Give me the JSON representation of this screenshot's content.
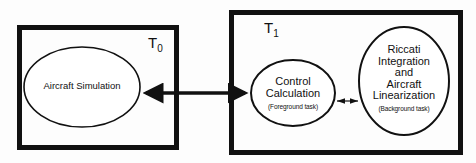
{
  "diagram": {
    "boxes": [
      {
        "id": "T0",
        "label_main": "T",
        "label_sub": "0"
      },
      {
        "id": "T1",
        "label_main": "T",
        "label_sub": "1"
      }
    ],
    "nodes": {
      "aircraft_simulation": {
        "label": "Aircraft Simulation"
      },
      "control_calculation": {
        "label_line1": "Control",
        "label_line2": "Calculation",
        "sublabel": "(Foreground task)"
      },
      "riccati": {
        "lines": [
          "Riccati",
          "Integration",
          "and",
          "Aircraft",
          "Linearization"
        ],
        "sublabel": "(Background task)"
      }
    },
    "edges": [
      {
        "from": "Aircraft Simulation",
        "to": "Control Calculation",
        "type": "bidirectional",
        "weight": "thick"
      },
      {
        "from": "Control Calculation",
        "to": "Riccati Integration and Aircraft Linearization",
        "type": "bidirectional",
        "weight": "thin"
      }
    ],
    "colors": {
      "stroke": "#111111",
      "background": "#fdfdfd"
    }
  }
}
